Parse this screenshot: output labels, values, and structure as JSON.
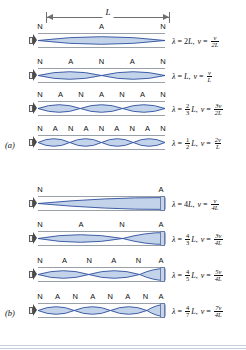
{
  "figure": {
    "length_label": "L",
    "panels": [
      {
        "tag": "(a)",
        "pipe_type": "open-open",
        "rows": [
          {
            "harmonic": 1,
            "marks": [
              "N",
              "A",
              "N"
            ],
            "wavelength": {
              "lambda": "λ",
              "equals": "=",
              "coef_num": "",
              "coef_den": "",
              "coef_whole": "2",
              "unit": "L"
            },
            "frequency": {
              "v": "v",
              "equals": "=",
              "num": "v",
              "den": "2L"
            }
          },
          {
            "harmonic": 2,
            "marks": [
              "N",
              "A",
              "N",
              "A",
              "N"
            ],
            "wavelength": {
              "lambda": "λ",
              "equals": "=",
              "coef_num": "",
              "coef_den": "",
              "coef_whole": "",
              "unit": "L"
            },
            "frequency": {
              "v": "v",
              "equals": "=",
              "num": "v",
              "den": "L"
            }
          },
          {
            "harmonic": 3,
            "marks": [
              "N",
              "A",
              "N",
              "A",
              "N",
              "A",
              "N"
            ],
            "wavelength": {
              "lambda": "λ",
              "equals": "=",
              "coef_num": "2",
              "coef_den": "3",
              "coef_whole": "",
              "unit": "L"
            },
            "frequency": {
              "v": "v",
              "equals": "=",
              "num": "3v",
              "den": "2L"
            }
          },
          {
            "harmonic": 4,
            "marks": [
              "N",
              "A",
              "N",
              "A",
              "N",
              "A",
              "N",
              "A",
              "N"
            ],
            "wavelength": {
              "lambda": "λ",
              "equals": "=",
              "coef_num": "1",
              "coef_den": "2",
              "coef_whole": "",
              "unit": "L"
            },
            "frequency": {
              "v": "v",
              "equals": "=",
              "num": "2v",
              "den": "L"
            }
          }
        ]
      },
      {
        "tag": "(b)",
        "pipe_type": "open-closed",
        "rows": [
          {
            "harmonic": 1,
            "marks": [
              "N",
              "A"
            ],
            "wavelength": {
              "lambda": "λ",
              "equals": "=",
              "coef_num": "",
              "coef_den": "",
              "coef_whole": "4",
              "unit": "L"
            },
            "frequency": {
              "v": "v",
              "equals": "=",
              "num": "v",
              "den": "4L"
            }
          },
          {
            "harmonic": 3,
            "marks": [
              "N",
              "A",
              "N",
              "A"
            ],
            "wavelength": {
              "lambda": "λ",
              "equals": "=",
              "coef_num": "4",
              "coef_den": "3",
              "coef_whole": "",
              "unit": "L"
            },
            "frequency": {
              "v": "v",
              "equals": "=",
              "num": "3v",
              "den": "4L"
            }
          },
          {
            "harmonic": 5,
            "marks": [
              "N",
              "A",
              "N",
              "A",
              "N",
              "A"
            ],
            "wavelength": {
              "lambda": "λ",
              "equals": "=",
              "coef_num": "4",
              "coef_den": "5",
              "coef_whole": "",
              "unit": "L"
            },
            "frequency": {
              "v": "v",
              "equals": "=",
              "num": "5v",
              "den": "4L"
            }
          },
          {
            "harmonic": 7,
            "marks": [
              "N",
              "A",
              "N",
              "A",
              "N",
              "A",
              "N",
              "A"
            ],
            "wavelength": {
              "lambda": "λ",
              "equals": "=",
              "coef_num": "4",
              "coef_den": "7",
              "coef_whole": "",
              "unit": "L"
            },
            "frequency": {
              "v": "v",
              "equals": "=",
              "num": "7v",
              "den": "4L"
            }
          }
        ]
      }
    ],
    "colors": {
      "wave_stroke": "#2c4f9e",
      "wave_fill": "#c3d3ea",
      "pipe_wall": "#9aa0a8",
      "cap_fill": "#c8d4e8",
      "rule": "#c6cfdd"
    }
  }
}
